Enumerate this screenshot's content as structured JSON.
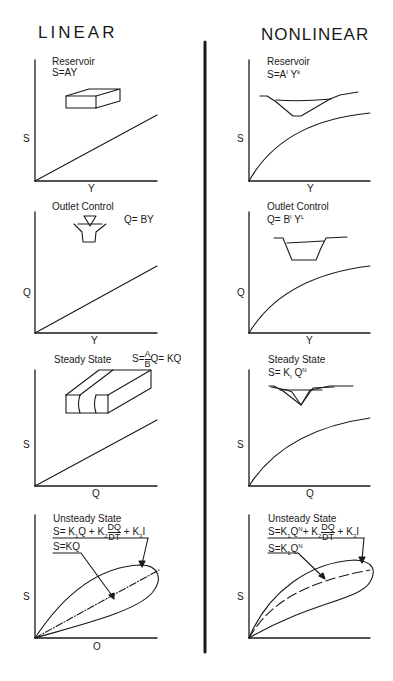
{
  "headers": {
    "linear": "LINEAR",
    "nonlinear": "NONLINEAR"
  },
  "linear": {
    "reservoir": {
      "title": "Reservoir",
      "equation": "S=AY",
      "y_axis": "S",
      "x_axis": "Y",
      "illustration": "rectangular-box"
    },
    "outlet": {
      "title": "Outlet   Control",
      "equation": "Q= BY",
      "y_axis": "Q",
      "x_axis": "Y",
      "illustration": "weir-with-water-level-marker"
    },
    "steady": {
      "title": "Steady   State",
      "eq_prefix": "S=",
      "frac_num": "A",
      "frac_den": "B",
      "eq_suffix": "Q= KQ",
      "y_axis": "S",
      "x_axis": "Q",
      "illustration": "rectangular-channel-section"
    },
    "unsteady": {
      "title": "Unsteady   State",
      "eq_a": "S= K",
      "eq_a_sub": "1",
      "eq_b": "Q + K",
      "eq_b_sub": "2",
      "frac_num": "DQ",
      "frac_den": "DT",
      "eq_c": " + K",
      "eq_c_sub": "3",
      "eq_d": "I",
      "callout": "S=KQ",
      "y_axis": "S",
      "x_axis": "O",
      "illustration": "hysteresis-loop"
    }
  },
  "nonlinear": {
    "reservoir": {
      "title": "Reservoir",
      "eq_base": "S=A",
      "eq_sup1": "I",
      "eq_mid": " Y",
      "eq_sup2": "k",
      "y_axis": "S",
      "x_axis": "Y",
      "illustration": "v-shaped-valley"
    },
    "outlet": {
      "title": "Outlet   Control",
      "eq_base": "Q= B",
      "eq_sup1": "I",
      "eq_mid": " Y",
      "eq_sup2": "L",
      "y_axis": "Q",
      "x_axis": "Y",
      "illustration": "trapezoidal-channel"
    },
    "steady": {
      "title": "Steady   State",
      "eq_base": "S= K",
      "eq_sub": "I",
      "eq_mid": " Q",
      "eq_sup": "N",
      "y_axis": "S",
      "x_axis": "Q",
      "illustration": "compound-v-channel"
    },
    "unsteady": {
      "title": "Unsteady   State",
      "eq_a": "S=K",
      "eq_a_sub": "1",
      "eq_a2": "Q",
      "eq_a_sup": "N",
      "eq_b": "+ K",
      "eq_b_sub": "2",
      "frac_num": "DQ",
      "frac_den": "DT",
      "eq_c": " + K",
      "eq_c_sub": "3",
      "eq_d": "I",
      "callout_base": "S=K",
      "callout_sub": "1",
      "callout_mid": "Q",
      "callout_sup": "N",
      "y_axis": "S",
      "x_axis": "Q",
      "illustration": "curved-hysteresis-loop"
    }
  },
  "colors": {
    "ink": "#1a1a1a",
    "background": "#ffffff"
  }
}
